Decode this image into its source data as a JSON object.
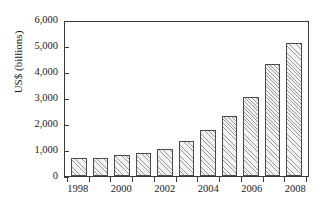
{
  "chart_data": {
    "type": "bar",
    "title": "",
    "xlabel": "",
    "ylabel": "US$ (billions)",
    "categories": [
      "1998",
      "1999",
      "2000",
      "2001",
      "2002",
      "2003",
      "2004",
      "2005",
      "2006",
      "2007",
      "2008"
    ],
    "values": [
      700,
      700,
      800,
      880,
      1060,
      1350,
      1810,
      2320,
      3070,
      4350,
      5200
    ],
    "ylim": [
      0,
      6000
    ],
    "ytick_values": [
      0,
      1000,
      2000,
      3000,
      4000,
      5000,
      6000
    ],
    "ytick_labels": [
      "0",
      "1,000",
      "2,000",
      "3,000",
      "4,000",
      "5,000",
      "6,000"
    ],
    "xtick_labels": [
      "1998",
      "2000",
      "2002",
      "2004",
      "2006",
      "2008"
    ],
    "xtick_categories": [
      "1998",
      "2000",
      "2002",
      "2004",
      "2006",
      "2008"
    ],
    "grid": false,
    "legend": null,
    "bar_fill": "#f2f2f2",
    "bar_hatch": "diagonal-lines",
    "bar_edge_color": "#4a4a4a",
    "axis_color": "#3a3a3a",
    "background": "#ffffff"
  }
}
